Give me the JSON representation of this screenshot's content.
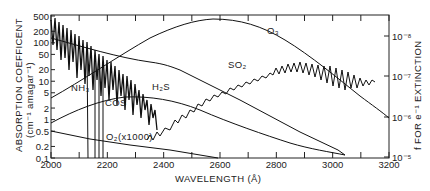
{
  "chart_data": {
    "type": "line",
    "title": "",
    "xlabel": "WAVELENGTH (Å)",
    "ylabel": "ABSORPTION COEFFICENT (cm⁻¹ amagar⁻¹)",
    "y2label": "f FOR e⁻¹ EXTINCTION",
    "xlim": [
      2000,
      3200
    ],
    "ylim": [
      0.1,
      500
    ],
    "yscale": "log",
    "x_ticks": [
      "2000",
      "2200",
      "2400",
      "2600",
      "2800",
      "3000",
      "3200"
    ],
    "y_ticks": [
      "500",
      "200",
      "100",
      "50",
      "20",
      "10",
      "5",
      "2",
      "1",
      "0.5",
      "0.2",
      "0.1"
    ],
    "y2_ticks": [
      "10⁻⁸",
      "10⁻⁷",
      "10⁻⁶",
      "10⁻⁵"
    ],
    "grid": false,
    "legend": "inline labels",
    "series": [
      {
        "name": "O3",
        "label": "O₃",
        "x": [
          2000,
          2100,
          2200,
          2300,
          2400,
          2500,
          2560,
          2600,
          2700,
          2800,
          2900,
          3000,
          3100,
          3200
        ],
        "values": [
          9,
          25,
          60,
          140,
          260,
          390,
          420,
          400,
          300,
          170,
          75,
          25,
          7,
          1.6
        ]
      },
      {
        "name": "H2S",
        "label": "H₂S",
        "x": [
          2000,
          2100,
          2200,
          2300,
          2400,
          2500,
          2600
        ],
        "values": [
          170,
          90,
          35,
          8,
          1.8,
          0.4,
          0.1
        ]
      },
      {
        "name": "COS",
        "label": "COS",
        "x": [
          2000,
          2100,
          2200,
          2300,
          2400,
          2500,
          2600
        ],
        "values": [
          0.7,
          2.0,
          3.2,
          2.8,
          1.3,
          0.4,
          0.12
        ]
      },
      {
        "name": "O2 (x1000)",
        "label": "O₂(x1000)",
        "x": [
          2000,
          2100,
          2200,
          2300,
          2400,
          2500,
          2590
        ],
        "values": [
          0.45,
          0.32,
          0.24,
          0.17,
          0.13,
          0.11,
          0.1
        ]
      },
      {
        "name": "NH3",
        "label": "NH₃",
        "x": [
          2000,
          2050,
          2100,
          2150,
          2200,
          2250,
          2300,
          2350
        ],
        "values": [
          300,
          150,
          80,
          40,
          20,
          8,
          3,
          0.8
        ]
      },
      {
        "name": "SO2",
        "label": "SO₂",
        "x": [
          2350,
          2400,
          2450,
          2500,
          2600,
          2700,
          2800,
          2900,
          3000,
          3100
        ],
        "values": [
          0.4,
          0.6,
          2,
          4,
          10,
          18,
          22,
          22,
          15,
          8
        ]
      }
    ]
  },
  "labels": {
    "ylabel_line1": "ABSORPTION COEFFICENT",
    "ylabel_line2": "(cm⁻¹ amagar⁻¹)",
    "y2label": "f FOR e⁻¹ EXTINCTION",
    "xlabel": "WAVELENGTH (Å)",
    "o3": "O₃",
    "so2": "SO₂",
    "h2s": "H₂S",
    "nh3": "NH₃",
    "cos": "COS",
    "o2": "O₂(x1000)"
  }
}
